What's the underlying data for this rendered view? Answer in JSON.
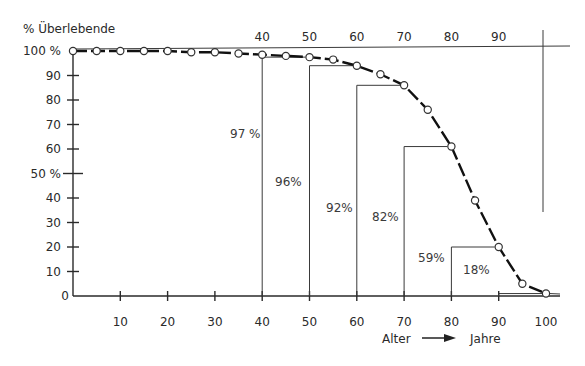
{
  "chart_data": {
    "type": "line",
    "title": "% Überlebende",
    "ylabel": "% Überlebende",
    "xlabel": "Alter → Jahre",
    "xlabel_left": "Alter",
    "xlabel_right": "Jahre",
    "xlim": [
      0,
      100
    ],
    "ylim": [
      0,
      100
    ],
    "grid": false,
    "x_ticks_bottom": [
      "10",
      "20",
      "30",
      "40",
      "50",
      "60",
      "70",
      "80",
      "90",
      "100"
    ],
    "x_ticks_top": [
      "40",
      "50",
      "60",
      "70",
      "80",
      "90"
    ],
    "y_ticks": [
      "0",
      "10",
      "20",
      "30",
      "40",
      "50 %",
      "60",
      "70",
      "80",
      "90",
      "100 %"
    ],
    "series": [
      {
        "name": "Überlebende",
        "x": [
          0,
          5,
          10,
          15,
          20,
          25,
          30,
          35,
          40,
          45,
          50,
          55,
          60,
          65,
          70,
          75,
          80,
          85,
          90,
          95,
          100
        ],
        "values": [
          100,
          100,
          100,
          100,
          100,
          99.5,
          99.5,
          99,
          98.5,
          98,
          97.5,
          96.5,
          94,
          90.5,
          86,
          76,
          61,
          39,
          20,
          5,
          1
        ]
      }
    ],
    "annotations": [
      {
        "age": 40,
        "label": "97 %",
        "step_from": 40,
        "step_to": 50
      },
      {
        "age": 50,
        "label": "96%",
        "step_from": 50,
        "step_to": 60
      },
      {
        "age": 60,
        "label": "92%",
        "step_from": 60,
        "step_to": 70
      },
      {
        "age": 70,
        "label": "82%",
        "step_from": 70,
        "step_to": 80
      },
      {
        "age": 80,
        "label": "59%",
        "step_from": 80,
        "step_to": 90
      },
      {
        "age": 90,
        "label": "18%",
        "step_from": 90,
        "step_to": 100
      }
    ]
  },
  "colors": {
    "ink": "#2a2a2a",
    "background": "#ffffff"
  }
}
